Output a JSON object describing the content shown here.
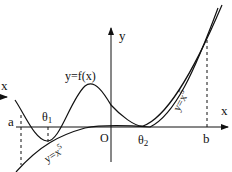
{
  "diagram": {
    "type": "function-graph",
    "axes": {
      "x_label": "x",
      "y_label": "y",
      "origin_label": "O",
      "left_edge_label": "x"
    },
    "points": {
      "a": "a",
      "theta1": "θ",
      "theta1_sub": "1",
      "theta2": "θ",
      "theta2_sub": "2",
      "b": "b"
    },
    "curves": [
      {
        "name": "f",
        "label": "y=f(x)"
      },
      {
        "name": "x5_left",
        "label_base": "y=x",
        "label_exp": "5"
      },
      {
        "name": "x5_right",
        "label_base": "y=x",
        "label_exp": "5"
      }
    ],
    "colors": {
      "stroke": "#111111",
      "background": "#ffffff"
    }
  }
}
